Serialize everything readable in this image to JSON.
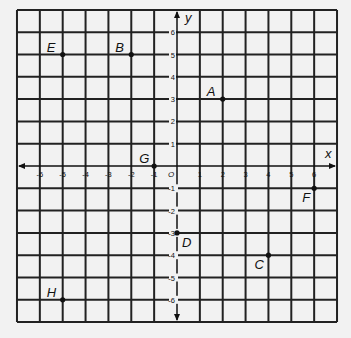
{
  "chart_data": {
    "type": "scatter",
    "title": "",
    "xlabel": "x",
    "ylabel": "y",
    "xlim": [
      -7,
      7
    ],
    "ylim": [
      -7,
      7
    ],
    "grid": true,
    "origin_label": "O",
    "x_ticks": [
      -6,
      -5,
      -4,
      -3,
      -2,
      -1,
      1,
      2,
      3,
      4,
      5,
      6
    ],
    "y_ticks": [
      -6,
      -5,
      -4,
      -3,
      -2,
      -1,
      1,
      2,
      3,
      4,
      5,
      6
    ],
    "points": [
      {
        "label": "A",
        "x": 2,
        "y": 3
      },
      {
        "label": "B",
        "x": -2,
        "y": 5
      },
      {
        "label": "C",
        "x": 4,
        "y": -4
      },
      {
        "label": "D",
        "x": 0,
        "y": -3
      },
      {
        "label": "E",
        "x": -5,
        "y": 5
      },
      {
        "label": "F",
        "x": 6,
        "y": -1
      },
      {
        "label": "G",
        "x": -1,
        "y": 0
      },
      {
        "label": "H",
        "x": -5,
        "y": -6
      }
    ]
  },
  "colors": {
    "background": "#f2f2f2",
    "grid": "#222222",
    "ink": "#111111"
  }
}
